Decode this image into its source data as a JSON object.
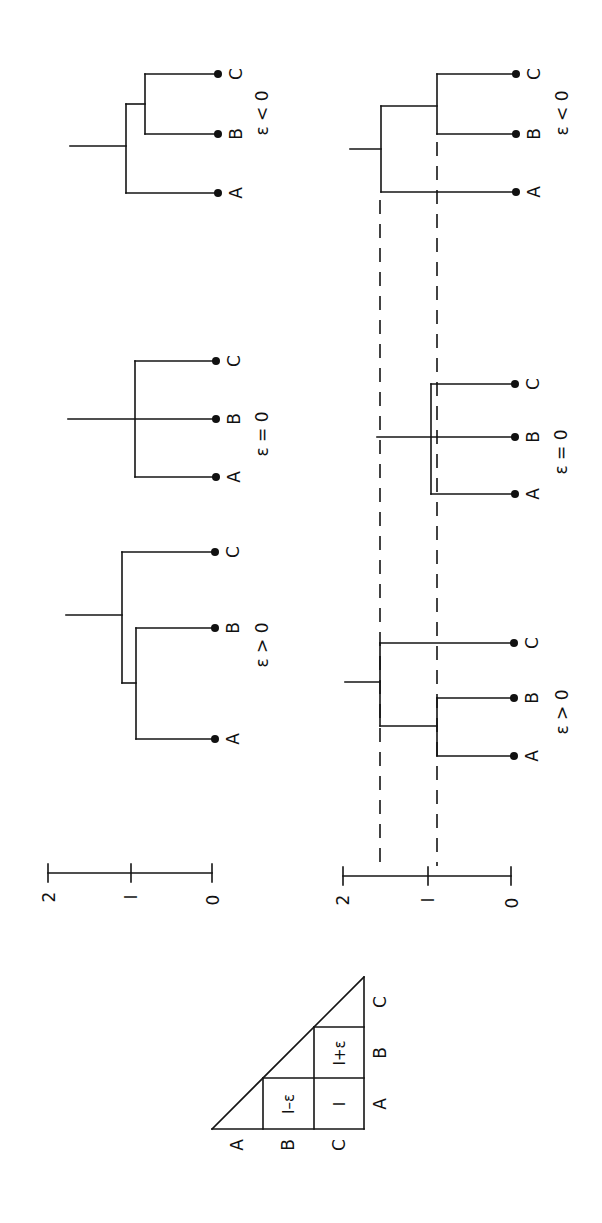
{
  "figure": {
    "orientation": "rotated -90deg (reads bottom-to-top)",
    "colors": {
      "ink": "#151515",
      "background": "#ffffff"
    }
  },
  "distance_matrix": {
    "row_labels": [
      "A",
      "B",
      "C"
    ],
    "col_labels": [
      "A",
      "B",
      "C"
    ],
    "cells": {
      "AB": "1-ε",
      "AC": "1",
      "BC": "1+ε"
    },
    "display": {
      "ab": "I–ε",
      "ac": "I",
      "bc": "I+ε"
    }
  },
  "scales": {
    "top": {
      "ticks": [
        "2",
        "I",
        "0"
      ]
    },
    "bottom": {
      "ticks": [
        "2",
        "I",
        "0"
      ]
    }
  },
  "top_row": {
    "trees": [
      {
        "id": "gt",
        "condition": "ε > 0",
        "leaves": [
          "A",
          "B",
          "C"
        ],
        "topology": "((A,B),C)"
      },
      {
        "id": "eq",
        "condition": "ε = 0",
        "leaves": [
          "A",
          "B",
          "C"
        ],
        "topology": "(A,B,C)"
      },
      {
        "id": "lt",
        "condition": "ε < 0",
        "leaves": [
          "A",
          "B",
          "C"
        ],
        "topology": "(A,(B,C))"
      }
    ]
  },
  "bottom_row": {
    "trees": [
      {
        "id": "gt",
        "condition": "ε > 0",
        "leaves": [
          "A",
          "B",
          "C"
        ],
        "topology": "((A,B),C)"
      },
      {
        "id": "eq",
        "condition": "ε = 0",
        "leaves": [
          "A",
          "B",
          "C"
        ],
        "topology": "(A,B,C)"
      },
      {
        "id": "lt",
        "condition": "ε < 0",
        "leaves": [
          "A",
          "B",
          "C"
        ],
        "topology": "(A,(B,C))"
      }
    ],
    "reference_lines": [
      "dashed",
      "dashed"
    ]
  }
}
